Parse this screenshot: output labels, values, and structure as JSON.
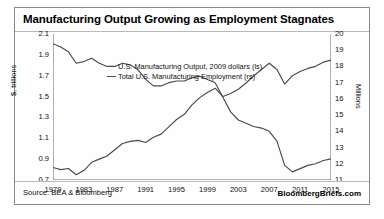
{
  "chart_data": {
    "type": "line",
    "title": "Manufacturing Output Growing as Employment Stagnates",
    "xlabel": "",
    "ylabel": "$, trillions",
    "y2label": "Millions",
    "grid": false,
    "legend_position": "top-center",
    "ylim": [
      0.7,
      2.1
    ],
    "y2lim": [
      11,
      20
    ],
    "xlim": [
      1979,
      2015
    ],
    "yticks": [
      "2.1",
      "1.9",
      "1.7",
      "1.5",
      "1.3",
      "1.1",
      "0.9",
      "0.7"
    ],
    "y2ticks": [
      "20",
      "19",
      "18",
      "17",
      "16",
      "15",
      "14",
      "13",
      "12",
      "11"
    ],
    "xticks": [
      "1979",
      "1983",
      "1987",
      "1991",
      "1995",
      "1999",
      "2003",
      "2007",
      "2011",
      "2015"
    ],
    "x": [
      1979,
      1980,
      1981,
      1982,
      1983,
      1984,
      1985,
      1986,
      1987,
      1988,
      1989,
      1990,
      1991,
      1992,
      1993,
      1994,
      1995,
      1996,
      1997,
      1998,
      1999,
      2000,
      2001,
      2002,
      2003,
      2004,
      2005,
      2006,
      2007,
      2008,
      2009,
      2010,
      2011,
      2012,
      2013,
      2014,
      2015
    ],
    "series": [
      {
        "name": "U.S. Manufacturing Output, 2009 dollars (ls)",
        "axis": "left",
        "color": "#4a4a4a",
        "units": "$, trillions",
        "values": [
          0.82,
          0.8,
          0.81,
          0.75,
          0.79,
          0.87,
          0.9,
          0.93,
          0.99,
          1.05,
          1.07,
          1.08,
          1.06,
          1.11,
          1.14,
          1.21,
          1.28,
          1.33,
          1.42,
          1.49,
          1.54,
          1.58,
          1.5,
          1.53,
          1.57,
          1.63,
          1.7,
          1.76,
          1.82,
          1.76,
          1.62,
          1.7,
          1.74,
          1.77,
          1.79,
          1.83,
          1.85
        ]
      },
      {
        "name": "Total U.S. Manufacturing Employment (rs)",
        "axis": "right",
        "color": "#4a4a4a",
        "units": "Millions",
        "values": [
          19.4,
          19.2,
          18.9,
          18.2,
          18.3,
          18.5,
          18.2,
          18.0,
          18.0,
          18.2,
          18.1,
          17.8,
          17.2,
          16.8,
          16.8,
          17.0,
          17.1,
          17.1,
          17.3,
          17.4,
          17.2,
          17.0,
          16.1,
          15.2,
          14.7,
          14.5,
          14.3,
          14.2,
          14.0,
          13.4,
          11.9,
          11.5,
          11.7,
          11.9,
          12.0,
          12.2,
          12.3
        ]
      }
    ]
  },
  "footer": {
    "source": "Source: BEA & Bloomberg",
    "brand": "BloombergBriefs.com"
  }
}
